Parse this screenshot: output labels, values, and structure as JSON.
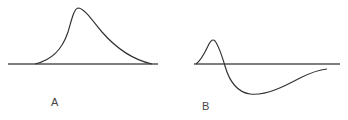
{
  "figure": {
    "panels": [
      {
        "id": "A",
        "label": "A",
        "description": "Single positive peak (monophasic) waveform above baseline"
      },
      {
        "id": "B",
        "label": "B",
        "description": "Biphasic waveform: small positive peak followed by larger, longer negative trough"
      }
    ],
    "colors": {
      "line": "#333333",
      "baseline": "#555555",
      "background": "#ffffff"
    }
  }
}
